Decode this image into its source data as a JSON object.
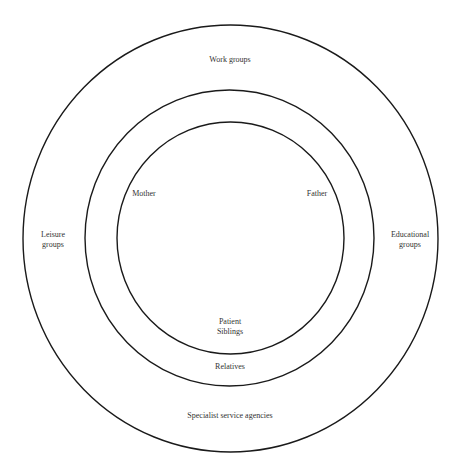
{
  "diagram": {
    "type": "concentric-circles",
    "stroke_color": "#1a1a1a",
    "rings": [
      {
        "name": "inner",
        "labels": [
          "Mother",
          "Father",
          "Patient",
          "Siblings"
        ]
      },
      {
        "name": "middle",
        "labels": [
          "Relatives"
        ]
      },
      {
        "name": "outer",
        "labels": [
          "Work groups",
          "Leisure groups",
          "Educational groups",
          "Specialist service agencies"
        ]
      }
    ],
    "labels": {
      "work_groups": "Work groups",
      "leisure_line1": "Leisure",
      "leisure_line2": "groups",
      "educational_line1": "Educational",
      "educational_line2": "groups",
      "mother": "Mother",
      "father": "Father",
      "patient": "Patient",
      "siblings": "Siblings",
      "relatives": "Relatives",
      "specialist": "Specialist service agencies"
    }
  }
}
